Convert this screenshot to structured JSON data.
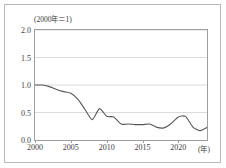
{
  "chart_data": {
    "type": "line",
    "title": "(2000年＝1)",
    "xlabel": "(年)",
    "ylabel": "",
    "xlim": [
      2000,
      2024
    ],
    "ylim": [
      0.0,
      2.0
    ],
    "grid": true,
    "legend": "none",
    "ytick_labels": [
      "0.0",
      "0.5",
      "1.0",
      "1.5",
      "2.0"
    ],
    "ytick_values": [
      0.0,
      0.5,
      1.0,
      1.5,
      2.0
    ],
    "xtick_labels": [
      "2000",
      "2005",
      "2010",
      "2015",
      "2020"
    ],
    "xtick_values": [
      2000,
      2005,
      2010,
      2015,
      2020
    ],
    "line_color": "#555555",
    "series": [
      {
        "name": "index",
        "x": [
          2000,
          2001,
          2002,
          2003,
          2004,
          2005,
          2006,
          2007,
          2008,
          2009,
          2010,
          2011,
          2012,
          2013,
          2014,
          2015,
          2016,
          2017,
          2018,
          2019,
          2020,
          2021,
          2022,
          2023,
          2024
        ],
        "values": [
          1.0,
          1.0,
          0.97,
          0.92,
          0.88,
          0.85,
          0.74,
          0.55,
          0.37,
          0.57,
          0.43,
          0.42,
          0.29,
          0.29,
          0.28,
          0.28,
          0.29,
          0.23,
          0.22,
          0.3,
          0.42,
          0.43,
          0.24,
          0.17,
          0.23
        ]
      }
    ]
  }
}
